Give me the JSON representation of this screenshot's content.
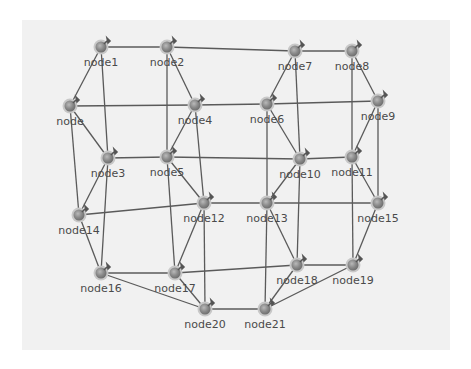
{
  "diagram": {
    "type": "network-graph",
    "colors": {
      "background": "#ffffff",
      "panel": "#f1f1f1",
      "edge": "#5a5a5a",
      "node_fill": "#8c8c8c",
      "node_ring": "#c8c8c8",
      "label": "#4a4a4a"
    },
    "nodes": [
      {
        "id": "node0",
        "label": "node",
        "x": 70,
        "y": 106,
        "icon": "node-pin-icon"
      },
      {
        "id": "node1",
        "label": "node1",
        "x": 101,
        "y": 47,
        "icon": "node-pin-icon"
      },
      {
        "id": "node2",
        "label": "node2",
        "x": 167,
        "y": 47,
        "icon": "node-pin-icon"
      },
      {
        "id": "node3",
        "label": "node3",
        "x": 108,
        "y": 158,
        "icon": "node-pin-icon"
      },
      {
        "id": "node4",
        "label": "node4",
        "x": 195,
        "y": 105,
        "icon": "node-pin-icon"
      },
      {
        "id": "node5",
        "label": "node5",
        "x": 167,
        "y": 157,
        "icon": "node-pin-icon"
      },
      {
        "id": "node6",
        "label": "node6",
        "x": 267,
        "y": 104,
        "icon": "node-pin-icon"
      },
      {
        "id": "node7",
        "label": "node7",
        "x": 295,
        "y": 51,
        "icon": "node-pin-icon"
      },
      {
        "id": "node8",
        "label": "node8",
        "x": 352,
        "y": 51,
        "icon": "node-pin-icon"
      },
      {
        "id": "node9",
        "label": "node9",
        "x": 378,
        "y": 101,
        "icon": "node-pin-icon"
      },
      {
        "id": "node10",
        "label": "node10",
        "x": 300,
        "y": 159,
        "icon": "node-pin-icon"
      },
      {
        "id": "node11",
        "label": "node11",
        "x": 352,
        "y": 157,
        "icon": "node-pin-icon"
      },
      {
        "id": "node12",
        "label": "node12",
        "x": 204,
        "y": 203,
        "icon": "node-pin-icon"
      },
      {
        "id": "node13",
        "label": "node13",
        "x": 267,
        "y": 203,
        "icon": "node-pin-icon"
      },
      {
        "id": "node14",
        "label": "node14",
        "x": 79,
        "y": 215,
        "icon": "node-pin-icon"
      },
      {
        "id": "node15",
        "label": "node15",
        "x": 378,
        "y": 203,
        "icon": "node-pin-icon"
      },
      {
        "id": "node16",
        "label": "node16",
        "x": 101,
        "y": 273,
        "icon": "node-pin-icon"
      },
      {
        "id": "node17",
        "label": "node17",
        "x": 175,
        "y": 273,
        "icon": "node-pin-icon"
      },
      {
        "id": "node18",
        "label": "node18",
        "x": 297,
        "y": 265,
        "icon": "node-pin-icon"
      },
      {
        "id": "node19",
        "label": "node19",
        "x": 353,
        "y": 265,
        "icon": "node-pin-icon"
      },
      {
        "id": "node20",
        "label": "node20",
        "x": 205,
        "y": 309,
        "icon": "node-pin-icon"
      },
      {
        "id": "node21",
        "label": "node21",
        "x": 265,
        "y": 309,
        "icon": "node-pin-icon"
      }
    ],
    "edges": [
      [
        "node1",
        "node2"
      ],
      [
        "node2",
        "node7"
      ],
      [
        "node7",
        "node8"
      ],
      [
        "node1",
        "node0"
      ],
      [
        "node1",
        "node3"
      ],
      [
        "node2",
        "node5"
      ],
      [
        "node2",
        "node4"
      ],
      [
        "node0",
        "node4"
      ],
      [
        "node0",
        "node3"
      ],
      [
        "node0",
        "node14"
      ],
      [
        "node4",
        "node6"
      ],
      [
        "node4",
        "node5"
      ],
      [
        "node4",
        "node12"
      ],
      [
        "node6",
        "node9"
      ],
      [
        "node7",
        "node6"
      ],
      [
        "node7",
        "node10"
      ],
      [
        "node8",
        "node9"
      ],
      [
        "node8",
        "node11"
      ],
      [
        "node3",
        "node5"
      ],
      [
        "node5",
        "node10"
      ],
      [
        "node10",
        "node11"
      ],
      [
        "node6",
        "node10"
      ],
      [
        "node6",
        "node13"
      ],
      [
        "node9",
        "node11"
      ],
      [
        "node9",
        "node15"
      ],
      [
        "node3",
        "node14"
      ],
      [
        "node3",
        "node16"
      ],
      [
        "node5",
        "node17"
      ],
      [
        "node5",
        "node12"
      ],
      [
        "node14",
        "node12"
      ],
      [
        "node12",
        "node13"
      ],
      [
        "node13",
        "node15"
      ],
      [
        "node10",
        "node13"
      ],
      [
        "node10",
        "node18"
      ],
      [
        "node11",
        "node15"
      ],
      [
        "node11",
        "node19"
      ],
      [
        "node14",
        "node16"
      ],
      [
        "node12",
        "node17"
      ],
      [
        "node12",
        "node20"
      ],
      [
        "node13",
        "node18"
      ],
      [
        "node13",
        "node21"
      ],
      [
        "node15",
        "node19"
      ],
      [
        "node16",
        "node17"
      ],
      [
        "node16",
        "node20"
      ],
      [
        "node17",
        "node18"
      ],
      [
        "node17",
        "node20"
      ],
      [
        "node18",
        "node19"
      ],
      [
        "node18",
        "node21"
      ],
      [
        "node19",
        "node21"
      ],
      [
        "node20",
        "node21"
      ]
    ]
  }
}
